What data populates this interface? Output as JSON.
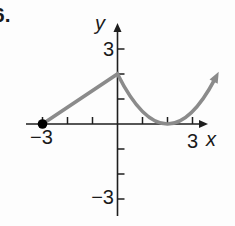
{
  "figure": {
    "problem_number": "6.",
    "axis": {
      "x_label": "x",
      "y_label": "y"
    },
    "tick_labels": {
      "x_neg": "−3",
      "x_pos": "3",
      "y_pos": "3",
      "y_neg": "−3"
    }
  },
  "colors": {
    "axis": "#1e1e1e",
    "curve": "#8b8b8b",
    "dot": "#000000",
    "label_text": "#1a1a1a",
    "background": "#fdfdfd"
  },
  "chart_data": {
    "type": "line",
    "xlabel": "x",
    "ylabel": "y",
    "xlim": [
      -3,
      3
    ],
    "ylim": [
      -3,
      3
    ],
    "grid": false,
    "x_ticks": [
      -3,
      -2,
      -1,
      1,
      2,
      3
    ],
    "y_ticks": [
      -3,
      -2,
      -1,
      1,
      2,
      3
    ],
    "labeled_ticks": {
      "x": [
        -3,
        3
      ],
      "y": [
        -3,
        3
      ]
    },
    "series": [
      {
        "name": "piecewise-curve",
        "segments": [
          {
            "kind": "line",
            "points": [
              [
                -3,
                0
              ],
              [
                0,
                2
              ]
            ]
          },
          {
            "kind": "parabola",
            "vertex": [
              2,
              0
            ],
            "a": 0.5,
            "from_x": 0,
            "to_x": 3.9
          }
        ],
        "start_marker": "closed-dot",
        "end_marker": "arrow"
      }
    ],
    "key_points": {
      "closed_endpoint": [
        -3,
        0
      ],
      "corner_peak": [
        0,
        2
      ],
      "vertex_on_x_axis": [
        2,
        0
      ]
    }
  }
}
